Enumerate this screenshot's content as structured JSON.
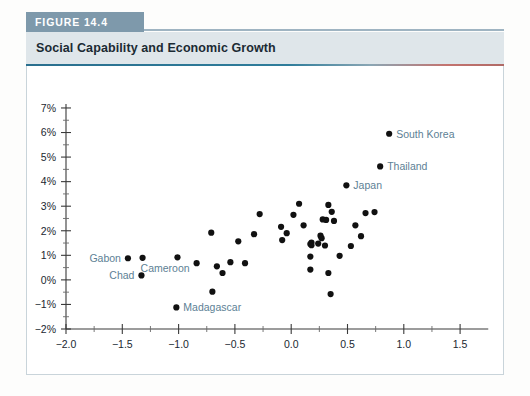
{
  "figure": {
    "tab_label": "FIGURE 14.4",
    "title": "Social Capability and Economic Growth",
    "tab_color": "#7e99ab",
    "band_color": "#dfe6ea"
  },
  "chart_data": {
    "type": "scatter",
    "title": "Social Capability and Economic Growth",
    "ylabel": "Growth rate of GDP per capita (1960–2005)",
    "xlabel": "Residual of social capability in 1960",
    "xlim": [
      -2.0,
      1.75
    ],
    "ylim": [
      -2,
      7
    ],
    "xticks": [
      -2.0,
      -1.5,
      -1.0,
      -0.5,
      0.0,
      0.5,
      1.0,
      1.5
    ],
    "xtick_labels": [
      "−2.0",
      "−1.5",
      "−1.0",
      "−0.5",
      "0.0",
      "0.5",
      "1.0",
      "1.5"
    ],
    "yticks": [
      -2,
      -1,
      0,
      1,
      2,
      3,
      4,
      5,
      6,
      7
    ],
    "ytick_labels": [
      "−2%",
      "−1%",
      "0%",
      "1%",
      "2%",
      "3%",
      "4%",
      "5%",
      "6%",
      "7%"
    ],
    "minor_ticks": true,
    "grid": false,
    "legend": null,
    "marker_color": "#111111",
    "label_color": "#5d7f95",
    "annotations": [
      {
        "text": "South Korea",
        "x": 0.87,
        "y": 5.95,
        "anchor": "left"
      },
      {
        "text": "Thailand",
        "x": 0.79,
        "y": 4.62,
        "anchor": "left"
      },
      {
        "text": "Japan",
        "x": 0.49,
        "y": 3.85,
        "anchor": "left"
      },
      {
        "text": "Gabon",
        "x": -1.45,
        "y": 0.88,
        "anchor": "right"
      },
      {
        "text": "Cameroon",
        "x": -1.32,
        "y": 0.9,
        "anchor": "below-right"
      },
      {
        "text": "Chad",
        "x": -1.33,
        "y": 0.18,
        "anchor": "right"
      },
      {
        "text": "Madagascar",
        "x": -1.02,
        "y": -1.12,
        "anchor": "left"
      }
    ],
    "points": [
      {
        "x": 0.87,
        "y": 5.95,
        "label": "South Korea"
      },
      {
        "x": 0.79,
        "y": 4.62,
        "label": "Thailand"
      },
      {
        "x": 0.49,
        "y": 3.85,
        "label": "Japan"
      },
      {
        "x": -1.45,
        "y": 0.88,
        "label": "Gabon"
      },
      {
        "x": -1.32,
        "y": 0.9,
        "label": "Cameroon"
      },
      {
        "x": -1.33,
        "y": 0.18,
        "label": "Chad"
      },
      {
        "x": -1.02,
        "y": -1.12,
        "label": "Madagascar"
      },
      {
        "x": 0.07,
        "y": 3.1,
        "label": null
      },
      {
        "x": 0.33,
        "y": 3.05,
        "label": null
      },
      {
        "x": 0.36,
        "y": 2.77,
        "label": null
      },
      {
        "x": -0.28,
        "y": 2.68,
        "label": null
      },
      {
        "x": 0.02,
        "y": 2.65,
        "label": null
      },
      {
        "x": 0.66,
        "y": 2.72,
        "label": null
      },
      {
        "x": 0.74,
        "y": 2.76,
        "label": null
      },
      {
        "x": 0.28,
        "y": 2.46,
        "label": null
      },
      {
        "x": 0.31,
        "y": 2.44,
        "label": null
      },
      {
        "x": 0.38,
        "y": 2.4,
        "label": null
      },
      {
        "x": 0.11,
        "y": 2.22,
        "label": null
      },
      {
        "x": 0.57,
        "y": 2.22,
        "label": null
      },
      {
        "x": -0.09,
        "y": 2.16,
        "label": null
      },
      {
        "x": -0.71,
        "y": 1.92,
        "label": null
      },
      {
        "x": -0.33,
        "y": 1.86,
        "label": null
      },
      {
        "x": -0.04,
        "y": 1.9,
        "label": null
      },
      {
        "x": 0.26,
        "y": 1.8,
        "label": null
      },
      {
        "x": 0.27,
        "y": 1.7,
        "label": null
      },
      {
        "x": 0.62,
        "y": 1.78,
        "label": null
      },
      {
        "x": -0.47,
        "y": 1.57,
        "label": null
      },
      {
        "x": -0.08,
        "y": 1.62,
        "label": null
      },
      {
        "x": 0.18,
        "y": 1.52,
        "label": null
      },
      {
        "x": 0.24,
        "y": 1.48,
        "label": null
      },
      {
        "x": 0.17,
        "y": 1.46,
        "label": null
      },
      {
        "x": 0.18,
        "y": 1.41,
        "label": null
      },
      {
        "x": 0.3,
        "y": 1.4,
        "label": null
      },
      {
        "x": -1.01,
        "y": 0.92,
        "label": null
      },
      {
        "x": -0.84,
        "y": 0.68,
        "label": null
      },
      {
        "x": -0.66,
        "y": 0.55,
        "label": null
      },
      {
        "x": -0.54,
        "y": 0.72,
        "label": null
      },
      {
        "x": -0.41,
        "y": 0.68,
        "label": null
      },
      {
        "x": -0.61,
        "y": 0.28,
        "label": null
      },
      {
        "x": 0.17,
        "y": 0.95,
        "label": null
      },
      {
        "x": 0.17,
        "y": 0.42,
        "label": null
      },
      {
        "x": 0.33,
        "y": 0.28,
        "label": null
      },
      {
        "x": 0.43,
        "y": 0.98,
        "label": null
      },
      {
        "x": 0.53,
        "y": 1.38,
        "label": null
      },
      {
        "x": -0.7,
        "y": -0.48,
        "label": null
      },
      {
        "x": 0.35,
        "y": -0.58,
        "label": null
      }
    ]
  }
}
